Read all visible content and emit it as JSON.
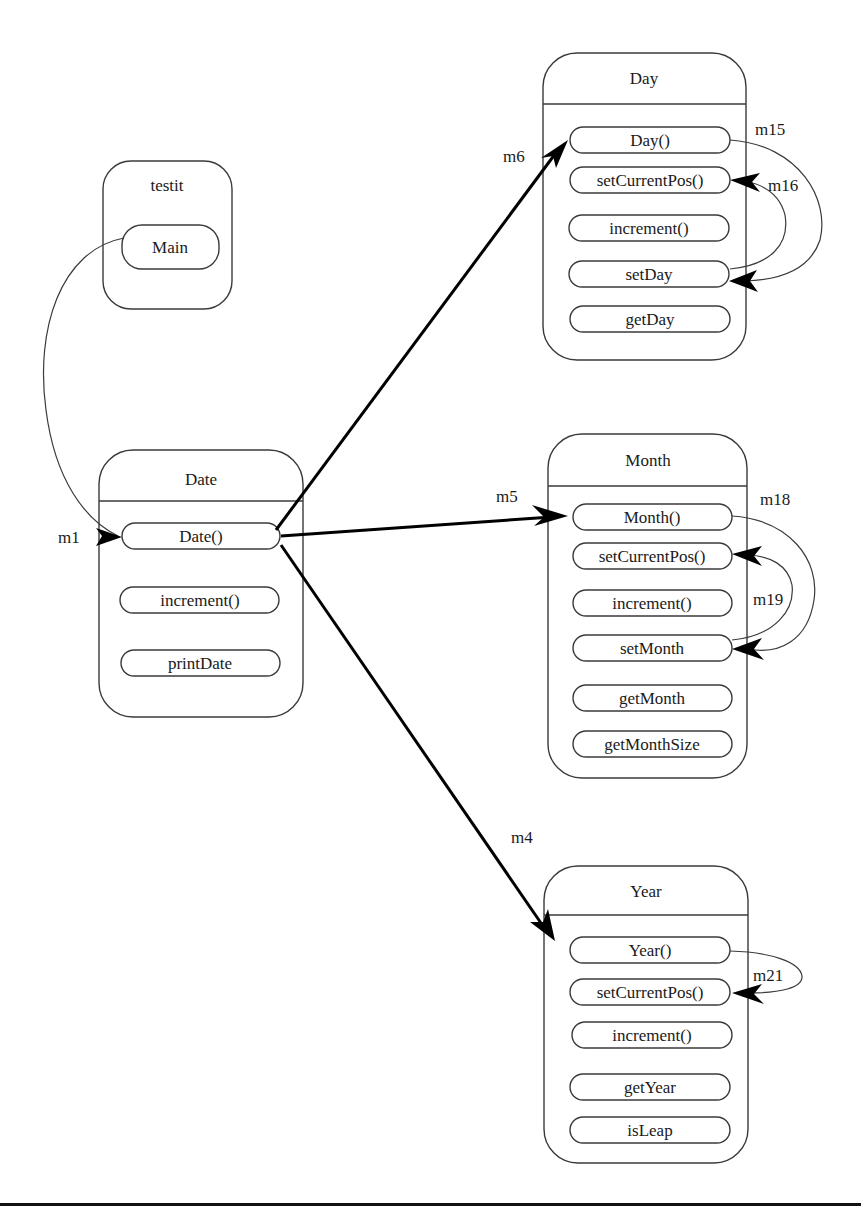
{
  "diagram": {
    "classes": {
      "testit": {
        "name": "testit",
        "methods": [
          "Main"
        ]
      },
      "date": {
        "name": "Date",
        "methods": [
          "Date()",
          "increment()",
          "printDate"
        ]
      },
      "day": {
        "name": "Day",
        "methods": [
          "Day()",
          "setCurrentPos()",
          "increment()",
          "setDay",
          "getDay"
        ]
      },
      "month": {
        "name": "Month",
        "methods": [
          "Month()",
          "setCurrentPos()",
          "increment()",
          "setMonth",
          "getMonth",
          "getMonthSize"
        ]
      },
      "year": {
        "name": "Year",
        "methods": [
          "Year()",
          "setCurrentPos()",
          "increment()",
          "getYear",
          "isLeap"
        ]
      }
    },
    "messages": [
      {
        "label": "m1",
        "from": "testit.Main",
        "to": "Date.Date()"
      },
      {
        "label": "m6",
        "from": "Date.Date()",
        "to": "Day.Day()"
      },
      {
        "label": "m5",
        "from": "Date.Date()",
        "to": "Month.Month()"
      },
      {
        "label": "m4",
        "from": "Date.Date()",
        "to": "Year.Year()"
      },
      {
        "label": "m15",
        "from": "Day.Day()",
        "to": "Day.setDay"
      },
      {
        "label": "m16",
        "from": "Day.setDay",
        "to": "Day.setCurrentPos()"
      },
      {
        "label": "m18",
        "from": "Month.Month()",
        "to": "Month.setMonth"
      },
      {
        "label": "m19",
        "from": "Month.setMonth",
        "to": "Month.setCurrentPos()"
      },
      {
        "label": "m21",
        "from": "Year.Year()",
        "to": "Year.setCurrentPos()"
      }
    ],
    "colors": {
      "stroke": "#3a3a3a",
      "arrow": "#000000",
      "background": "#ffffff"
    }
  }
}
